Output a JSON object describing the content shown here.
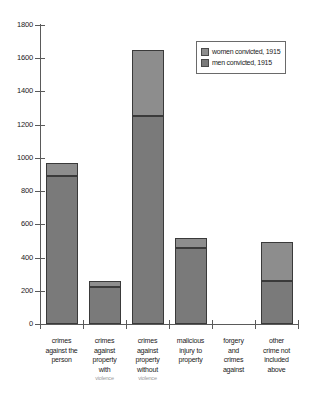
{
  "chart_data": {
    "type": "bar",
    "title": "",
    "subtitle": "",
    "xlabel": "",
    "ylabel": "",
    "stacked": true,
    "grid": false,
    "legend_position": "top-right",
    "ylim": [
      0,
      1800
    ],
    "ytick_values": [
      0,
      200,
      400,
      600,
      800,
      1000,
      1200,
      1400,
      1600,
      1800
    ],
    "ytick_labels": [
      "0",
      "200",
      "400",
      "600",
      "800",
      "1000",
      "1200",
      "1400",
      "1600",
      "1800"
    ],
    "categories": [
      [
        "crimes",
        "against the",
        "person"
      ],
      [
        "crimes",
        "against",
        "property",
        "with",
        "violence"
      ],
      [
        "crimes",
        "against",
        "property",
        "without",
        "violence"
      ],
      [
        "malicious",
        "injury to",
        "property"
      ],
      [
        "forgery",
        "and",
        "crimes",
        "against"
      ],
      [
        "other",
        "crime not",
        "included",
        "above"
      ]
    ],
    "series": [
      {
        "name": "men convicted, 1915",
        "color": "#7a7a7a",
        "values": [
          890,
          225,
          1250,
          460,
          0,
          260
        ]
      },
      {
        "name": "women convicted, 1915",
        "color": "#8d8d8d",
        "values": [
          80,
          35,
          400,
          58,
          0,
          234
        ]
      }
    ],
    "totals": [
      970,
      260,
      1650,
      518,
      0,
      494
    ]
  },
  "legend": {
    "entries": [
      {
        "label": "women convicted, 1915",
        "swatch": "women-swatch"
      },
      {
        "label": "men convicted, 1915",
        "swatch": "men-swatch"
      }
    ]
  }
}
